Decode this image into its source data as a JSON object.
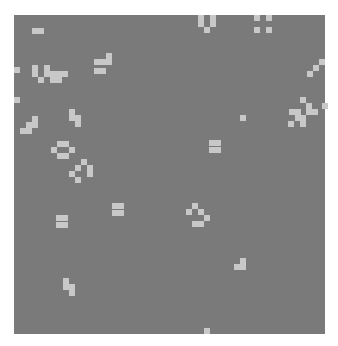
{
  "board": {
    "background": "#7a7a7a",
    "live_color": "#c8c8c8",
    "origin": [
      14,
      15
    ],
    "size": [
      311,
      319
    ],
    "cell_px": 6,
    "live_cells_px": [
      [
        32,
        28
      ],
      [
        38,
        28
      ],
      [
        198,
        15
      ],
      [
        198,
        21
      ],
      [
        210,
        15
      ],
      [
        210,
        21
      ],
      [
        204,
        27
      ],
      [
        254,
        15
      ],
      [
        266,
        15
      ],
      [
        254,
        27
      ],
      [
        266,
        27
      ],
      [
        106,
        53
      ],
      [
        106,
        59
      ],
      [
        94,
        59
      ],
      [
        100,
        59
      ],
      [
        94,
        68
      ],
      [
        100,
        68
      ],
      [
        14,
        67
      ],
      [
        32,
        65
      ],
      [
        32,
        71
      ],
      [
        44,
        65
      ],
      [
        44,
        71
      ],
      [
        50,
        71
      ],
      [
        56,
        71
      ],
      [
        62,
        71
      ],
      [
        38,
        77
      ],
      [
        50,
        77
      ],
      [
        56,
        77
      ],
      [
        319,
        59
      ],
      [
        313,
        65
      ],
      [
        307,
        71
      ],
      [
        14,
        97
      ],
      [
        69,
        109
      ],
      [
        69,
        115
      ],
      [
        75,
        115
      ],
      [
        75,
        121
      ],
      [
        32,
        116
      ],
      [
        32,
        122
      ],
      [
        26,
        122
      ],
      [
        20,
        128
      ],
      [
        26,
        128
      ],
      [
        240,
        115
      ],
      [
        300,
        97
      ],
      [
        306,
        103
      ],
      [
        322,
        103
      ],
      [
        289,
        109
      ],
      [
        295,
        109
      ],
      [
        306,
        109
      ],
      [
        312,
        109
      ],
      [
        295,
        115
      ],
      [
        300,
        115
      ],
      [
        288,
        121
      ],
      [
        300,
        121
      ],
      [
        209,
        140
      ],
      [
        215,
        140
      ],
      [
        209,
        147
      ],
      [
        215,
        147
      ],
      [
        57,
        141
      ],
      [
        63,
        141
      ],
      [
        51,
        147
      ],
      [
        69,
        147
      ],
      [
        57,
        153
      ],
      [
        63,
        153
      ],
      [
        81,
        159
      ],
      [
        75,
        165
      ],
      [
        87,
        165
      ],
      [
        87,
        171
      ],
      [
        69,
        171
      ],
      [
        75,
        177
      ],
      [
        112,
        203
      ],
      [
        118,
        203
      ],
      [
        112,
        210
      ],
      [
        118,
        210
      ],
      [
        56,
        215
      ],
      [
        62,
        215
      ],
      [
        56,
        222
      ],
      [
        62,
        222
      ],
      [
        192,
        203
      ],
      [
        186,
        209
      ],
      [
        198,
        209
      ],
      [
        204,
        215
      ],
      [
        192,
        221
      ],
      [
        198,
        221
      ],
      [
        240,
        258
      ],
      [
        240,
        264
      ],
      [
        234,
        264
      ],
      [
        63,
        278
      ],
      [
        63,
        284
      ],
      [
        69,
        284
      ],
      [
        69,
        290
      ],
      [
        204,
        328
      ]
    ]
  }
}
